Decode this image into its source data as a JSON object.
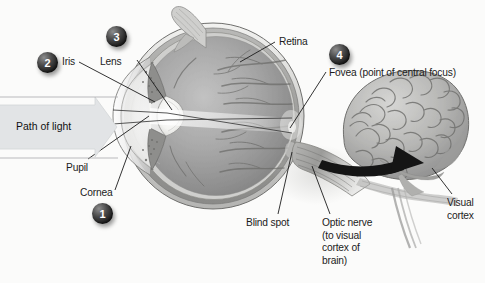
{
  "figure": {
    "background_color": "#fbfbfa",
    "line_color": "#1c1c1c",
    "badge_color": "#232323",
    "badge_text_color": "#ffffff",
    "arrow_band_color": "#e2e4e6"
  },
  "light_arrow": {
    "label": "Path of light",
    "direction": "left-to-right"
  },
  "badges": [
    {
      "number": "1",
      "refers_to": "Cornea",
      "x": 92,
      "y": 203
    },
    {
      "number": "2",
      "refers_to": "Iris",
      "x": 37,
      "y": 52
    },
    {
      "number": "3",
      "refers_to": "Lens",
      "x": 106,
      "y": 26
    },
    {
      "number": "4",
      "refers_to": "Fovea",
      "x": 329,
      "y": 44
    }
  ],
  "labels": {
    "iris": "Iris",
    "lens": "Lens",
    "retina": "Retina",
    "fovea": "Fovea (point of central focus)",
    "pupil": "Pupil",
    "cornea": "Cornea",
    "blind_spot": "Blind spot",
    "optic_nerve_line1": "Optic nerve",
    "optic_nerve_line2": "(to visual",
    "optic_nerve_line3": "cortex of",
    "optic_nerve_line4": "brain)",
    "visual_cortex_line1": "Visual",
    "visual_cortex_line2": "cortex"
  },
  "anatomy_parts": [
    "cornea",
    "pupil",
    "iris",
    "lens",
    "vitreous humor",
    "retina",
    "fovea",
    "blind spot",
    "optic nerve",
    "eye muscle",
    "brain",
    "visual cortex"
  ]
}
